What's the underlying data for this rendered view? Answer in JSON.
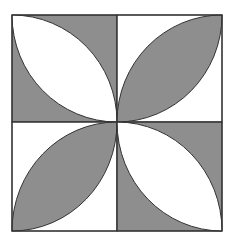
{
  "figure": {
    "colors": {
      "background": "#ffffff",
      "shaded": "#8e8e8e",
      "stroke": "#333333"
    },
    "quadrants": [
      {
        "position": "top-left",
        "fill": "shaded",
        "lens_fill": "white",
        "lens_diagonal": "top-left-to-center"
      },
      {
        "position": "top-right",
        "fill": "white",
        "lens_fill": "shaded",
        "lens_diagonal": "center-to-top-right"
      },
      {
        "position": "bottom-left",
        "fill": "white",
        "lens_fill": "shaded",
        "lens_diagonal": "center-to-bottom-left"
      },
      {
        "position": "bottom-right",
        "fill": "shaded",
        "lens_fill": "white",
        "lens_diagonal": "center-to-bottom-right"
      }
    ]
  }
}
